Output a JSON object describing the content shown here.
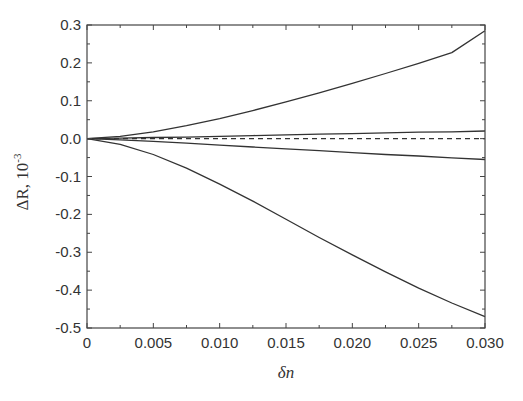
{
  "chart_data": {
    "type": "line",
    "title": "",
    "xlabel": "δn",
    "ylabel": "ΔR, 10^-3",
    "ylabel_main": "ΔR, 10",
    "ylabel_exp": "-3",
    "xlim": [
      0,
      0.03
    ],
    "ylim": [
      -0.5,
      0.3
    ],
    "x_ticks": [
      "0",
      "0.005",
      "0.010",
      "0.015",
      "0.020",
      "0.025",
      "0.030"
    ],
    "y_ticks": [
      "0.3",
      "0.2",
      "0.1",
      "0.0",
      "-0.1",
      "-0.2",
      "-0.3",
      "-0.4",
      "-0.5"
    ],
    "grid": false,
    "legend": null,
    "x": [
      0,
      0.0025,
      0.005,
      0.0075,
      0.01,
      0.0125,
      0.015,
      0.0175,
      0.02,
      0.0225,
      0.025,
      0.0275,
      0.03
    ],
    "series": [
      {
        "name": "upper-curve",
        "style": "solid",
        "values": [
          0,
          0.006,
          0.018,
          0.034,
          0.053,
          0.074,
          0.097,
          0.121,
          0.146,
          0.172,
          0.199,
          0.227,
          0.285
        ]
      },
      {
        "name": "small-positive",
        "style": "solid",
        "values": [
          0,
          0.001,
          0.003,
          0.004,
          0.006,
          0.008,
          0.01,
          0.012,
          0.013,
          0.015,
          0.017,
          0.018,
          0.02
        ]
      },
      {
        "name": "zero-reference",
        "style": "dashed",
        "values": [
          0,
          0,
          0,
          0,
          0,
          0,
          0,
          0,
          0,
          0,
          0,
          0,
          0
        ]
      },
      {
        "name": "small-negative",
        "style": "solid",
        "values": [
          0,
          -0.003,
          -0.007,
          -0.012,
          -0.017,
          -0.022,
          -0.027,
          -0.032,
          -0.037,
          -0.042,
          -0.046,
          -0.051,
          -0.055
        ]
      },
      {
        "name": "lower-curve",
        "style": "solid",
        "values": [
          0,
          -0.015,
          -0.042,
          -0.078,
          -0.12,
          -0.165,
          -0.213,
          -0.261,
          -0.307,
          -0.352,
          -0.395,
          -0.434,
          -0.47
        ]
      }
    ]
  },
  "colors": {
    "line": "#333333",
    "axis": "#444444",
    "background": "#ffffff"
  }
}
